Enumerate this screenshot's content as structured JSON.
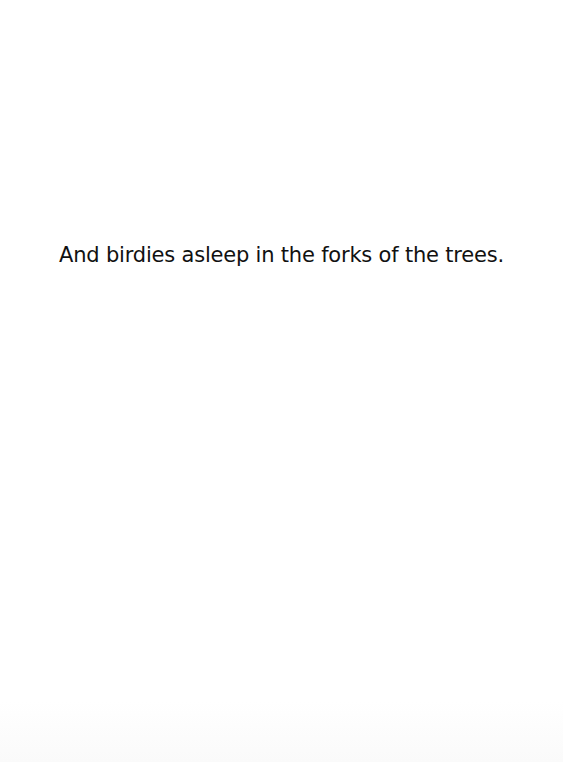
{
  "page": {
    "background_color": "#ffffff",
    "text_color": "#111111",
    "lines": [
      "And birdies asleep in the forks of the trees."
    ]
  }
}
